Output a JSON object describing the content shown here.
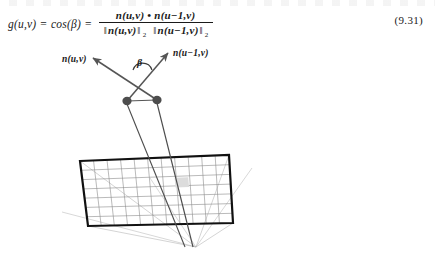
{
  "document": {
    "type": "textbook-figure-page",
    "background_color": "#ffffff",
    "ink_color": "#1a1a1a"
  },
  "equation": {
    "lhs": "g(u,v)",
    "equals_1": "=",
    "cos_term": "cos(β)",
    "equals_2": "=",
    "numerator": {
      "left_vector": "n",
      "left_args": "(u,v)",
      "operator": "•",
      "right_vector": "n",
      "right_args": "(u−1,v)"
    },
    "denominator": {
      "left_norm_open": "‖",
      "left_vector": "n",
      "left_args": "(u,v)",
      "left_norm_close": "‖",
      "left_subscript": "2",
      "right_norm_open": "‖",
      "right_vector": "n",
      "right_args": "(u−1,v)",
      "right_norm_close": "‖",
      "right_subscript": "2"
    },
    "number": "(9.31)"
  },
  "figure": {
    "labels": {
      "normal_left_vector": "n",
      "normal_left_args": "(u,v)",
      "normal_right_vector": "n",
      "normal_right_args": "(u−1,v)",
      "angle": "β"
    },
    "colors": {
      "vector_arrow": "#555555",
      "vertex_dot": "#4d4d4d",
      "mesh_border": "#111111",
      "mesh_grid": "#8c8c8c",
      "projection_ray": "#a6a6a6",
      "highlight_cell": "#d9d9d9"
    },
    "mesh": {
      "columns": 11,
      "rows": 7,
      "corners": {
        "top_left": [
          80,
          161
        ],
        "top_right": [
          229,
          155
        ],
        "bottom_right": [
          233,
          223
        ],
        "bottom_left": [
          88,
          226
        ]
      },
      "highlight_cell_index": [
        5,
        2
      ]
    },
    "vertices": [
      [
        127,
        101
      ],
      [
        157,
        100
      ]
    ],
    "arrow_tips": [
      [
        92,
        57
      ],
      [
        169,
        52
      ]
    ],
    "angle_vertex": [
      143,
      76
    ],
    "camera_focus": [
      196,
      247
    ]
  }
}
